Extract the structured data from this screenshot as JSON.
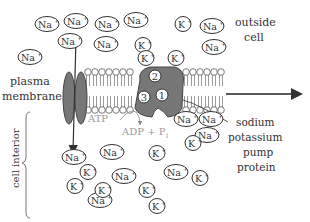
{
  "labels": {
    "outside_cell": [
      "outside",
      "cell"
    ],
    "plasma_membrane": [
      "plasma",
      "membrane"
    ],
    "cell_interior": "cell interior",
    "pump": [
      "sodium",
      "potassium",
      "pump",
      "protein"
    ],
    "atp": "ATP",
    "adp": "ADP + P",
    "adp_sub": "i"
  },
  "pump_sites": [
    "1",
    "2",
    "3"
  ],
  "ions_outside": [
    {
      "type": "Na",
      "label": "Na",
      "charge": "+"
    },
    {
      "type": "Na",
      "label": "Na",
      "charge": "+"
    },
    {
      "type": "Na",
      "label": "Na",
      "charge": "+"
    },
    {
      "type": "Na",
      "label": "Na",
      "charge": "+"
    },
    {
      "type": "Na",
      "label": "Na",
      "charge": "+"
    },
    {
      "type": "Na",
      "label": "Na",
      "charge": "+"
    },
    {
      "type": "Na",
      "label": "Na",
      "charge": "+"
    },
    {
      "type": "Na",
      "label": "Na",
      "charge": "+"
    },
    {
      "type": "Na",
      "label": "Na",
      "charge": "+"
    },
    {
      "type": "K",
      "label": "K",
      "charge": "+"
    },
    {
      "type": "K",
      "label": "K",
      "charge": "+"
    },
    {
      "type": "K",
      "label": "K",
      "charge": "+"
    },
    {
      "type": "K",
      "label": "K",
      "charge": "+"
    }
  ],
  "ions_inside": [
    {
      "type": "Na",
      "label": "Na",
      "charge": "+"
    },
    {
      "type": "Na",
      "label": "Na",
      "charge": "+"
    },
    {
      "type": "Na",
      "label": "Na",
      "charge": "+"
    },
    {
      "type": "Na",
      "label": "Na",
      "charge": "+"
    },
    {
      "type": "Na",
      "label": "Na",
      "charge": "+"
    },
    {
      "type": "Na",
      "label": "Na",
      "charge": "+"
    },
    {
      "type": "Na",
      "label": "Na",
      "charge": "+"
    },
    {
      "type": "Na",
      "label": "Na",
      "charge": "+"
    },
    {
      "type": "K",
      "label": "K",
      "charge": "+"
    },
    {
      "type": "K",
      "label": "K",
      "charge": "+"
    },
    {
      "type": "K",
      "label": "K",
      "charge": "+"
    },
    {
      "type": "K",
      "label": "K",
      "charge": "+"
    },
    {
      "type": "K",
      "label": "K",
      "charge": "+"
    },
    {
      "type": "K",
      "label": "K",
      "charge": "+"
    },
    {
      "type": "K",
      "label": "K",
      "charge": "+"
    },
    {
      "type": "K",
      "label": "K",
      "charge": "+"
    }
  ]
}
